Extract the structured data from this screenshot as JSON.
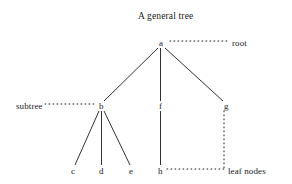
{
  "figure": {
    "title": "A general tree",
    "title_pos": {
      "x": 138,
      "y": 12
    },
    "background_color": "#ffffff",
    "ink_color": "#1a1a1a"
  },
  "tree": {
    "nodes": [
      {
        "id": "a",
        "label": "a",
        "x": 161,
        "y": 43,
        "level": 0
      },
      {
        "id": "b",
        "label": "b",
        "x": 101,
        "y": 106,
        "level": 1
      },
      {
        "id": "f",
        "label": "f",
        "x": 160,
        "y": 106,
        "level": 1
      },
      {
        "id": "g",
        "label": "g",
        "x": 226,
        "y": 106,
        "level": 1
      },
      {
        "id": "c",
        "label": "c",
        "x": 73,
        "y": 171,
        "level": 2
      },
      {
        "id": "d",
        "label": "d",
        "x": 101,
        "y": 171,
        "level": 2
      },
      {
        "id": "e",
        "label": "e",
        "x": 131,
        "y": 171,
        "level": 2
      },
      {
        "id": "h",
        "label": "h",
        "x": 160,
        "y": 171,
        "level": 2
      }
    ],
    "edges": [
      {
        "from": "a",
        "to": "b"
      },
      {
        "from": "a",
        "to": "f"
      },
      {
        "from": "a",
        "to": "g"
      },
      {
        "from": "b",
        "to": "c"
      },
      {
        "from": "b",
        "to": "d"
      },
      {
        "from": "b",
        "to": "e"
      },
      {
        "from": "f",
        "to": "h"
      }
    ]
  },
  "annotations": [
    {
      "id": "root",
      "label": "root",
      "label_x": 232,
      "label_y": 43,
      "leader": {
        "x1": 170,
        "y1": 41,
        "x2": 228,
        "y2": 41
      }
    },
    {
      "id": "subtree",
      "label": "subtree",
      "label_x": 16,
      "label_y": 106,
      "leader": {
        "x1": 45,
        "y1": 104,
        "x2": 96,
        "y2": 104
      }
    },
    {
      "id": "leaf-nodes",
      "label": "leaf nodes",
      "label_x": 228,
      "label_y": 171,
      "leader": {
        "x1": 167,
        "y1": 169,
        "x2": 224,
        "y2": 169
      },
      "leader_vertical": {
        "x1": 224,
        "y1": 111,
        "x2": 224,
        "y2": 169
      }
    }
  ]
}
